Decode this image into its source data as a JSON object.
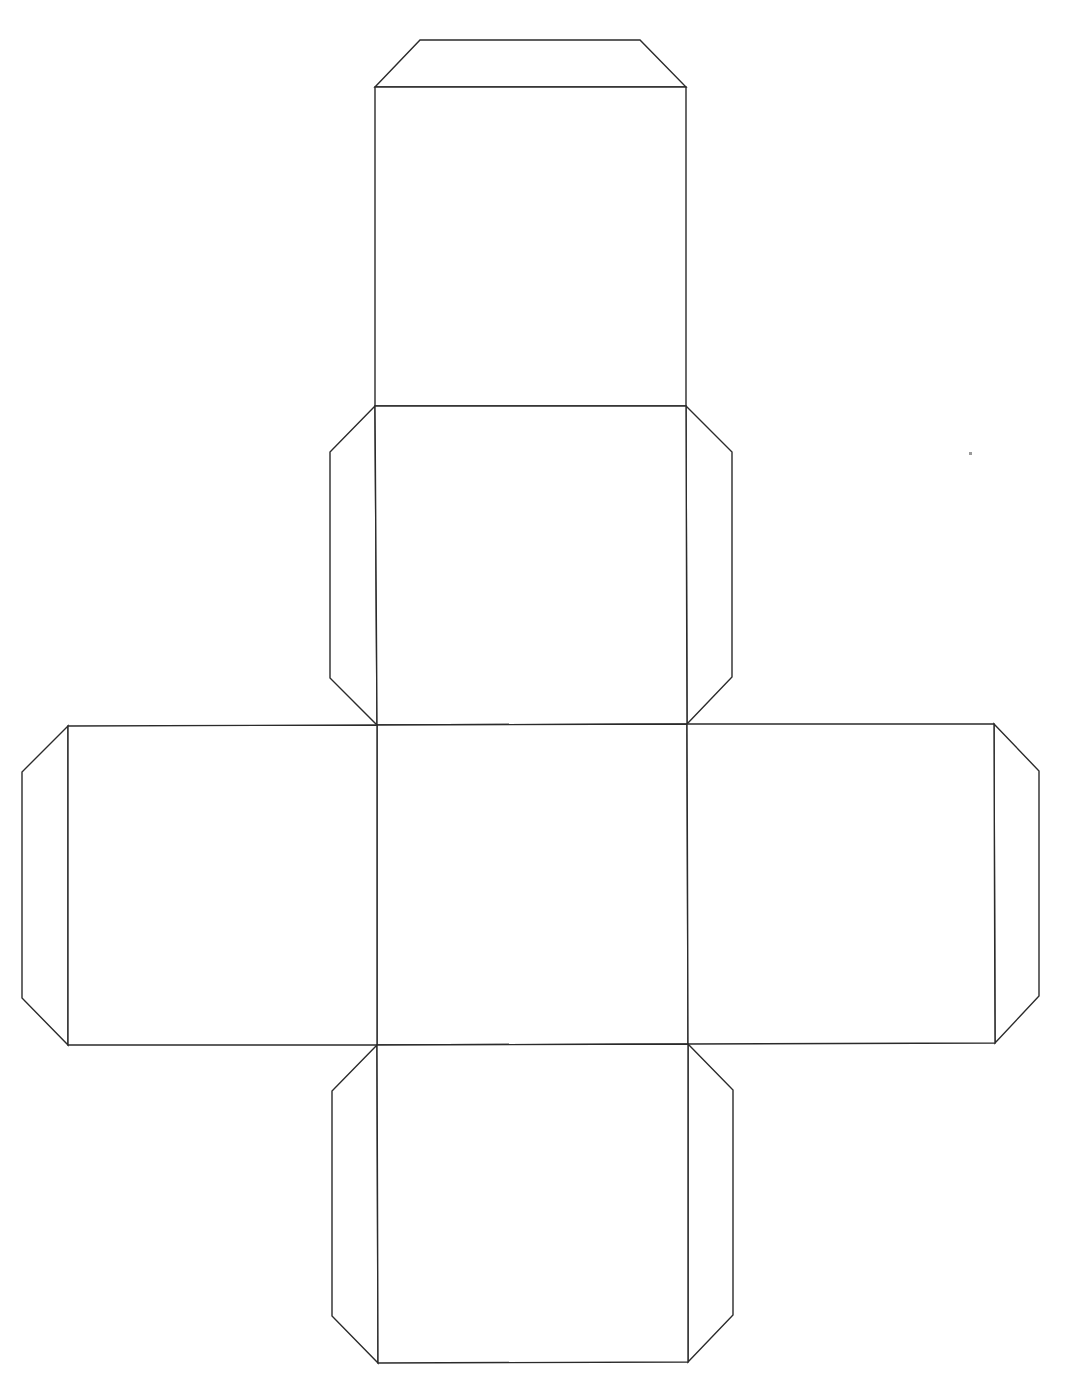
{
  "diagram": {
    "title": "Cube net template",
    "type": "cube-net",
    "canvas": {
      "width": 1070,
      "height": 1395
    },
    "line_color": "#2b2b2b",
    "fill_color": "#ffffff",
    "faces": [
      {
        "id": "face-top",
        "label": "Top face",
        "points": "375,87 686,87 686,406 375,406"
      },
      {
        "id": "face-upper",
        "label": "Upper middle face",
        "points": "375,406 686,406 687,724 377,725"
      },
      {
        "id": "face-center",
        "label": "Center face",
        "points": "377,725 687,724 688,1044 377,1045"
      },
      {
        "id": "face-left",
        "label": "Left face",
        "points": "68,726 377,725 377,1045 68,1045"
      },
      {
        "id": "face-right",
        "label": "Right face",
        "points": "687,724 994,724 995,1043 688,1044"
      },
      {
        "id": "face-bottom",
        "label": "Bottom face",
        "points": "377,1045 688,1044 688,1362 378,1363"
      }
    ],
    "tabs": [
      {
        "id": "tab-top",
        "label": "Top glue tab",
        "points": "375,87 420,40 640,40 686,87"
      },
      {
        "id": "tab-upper-left",
        "label": "Upper-left glue tab",
        "points": "375,406 330,452 330,678 377,725"
      },
      {
        "id": "tab-upper-right",
        "label": "Upper-right glue tab",
        "points": "686,406 732,452 732,677 687,724"
      },
      {
        "id": "tab-left",
        "label": "Left glue tab",
        "points": "68,726 22,772 22,998 68,1045"
      },
      {
        "id": "tab-right",
        "label": "Right glue tab",
        "points": "994,724 1039,771 1039,996 995,1043"
      },
      {
        "id": "tab-bottom-left",
        "label": "Bottom-left glue tab",
        "points": "377,1045 332,1091 332,1316 378,1363"
      },
      {
        "id": "tab-bottom-right",
        "label": "Bottom-right glue tab",
        "points": "688,1044 733,1090 733,1315 688,1362"
      }
    ]
  }
}
